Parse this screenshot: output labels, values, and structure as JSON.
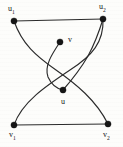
{
  "figure": {
    "type": "undirected-graph-diagram",
    "background_color": "#fdfdfb",
    "edge_color": "#2b2b2b",
    "node_color": "#151515",
    "width": 123,
    "height": 147
  },
  "nodes": [
    {
      "id": "u1",
      "label_main": "u",
      "label_sub": "1",
      "x": 14,
      "y": 21,
      "label_x": 8,
      "label_y": 5,
      "radius": 3.1
    },
    {
      "id": "u2",
      "label_main": "u",
      "label_sub": "2",
      "x": 103,
      "y": 19,
      "label_x": 99,
      "label_y": 3,
      "radius": 3.1
    },
    {
      "id": "v",
      "label_main": "v",
      "label_sub": "",
      "x": 60,
      "y": 42,
      "label_x": 68,
      "label_y": 36,
      "radius": 3.1
    },
    {
      "id": "u",
      "label_main": "u",
      "label_sub": "",
      "x": 63,
      "y": 90,
      "label_x": 61,
      "label_y": 98,
      "radius": 3.1
    },
    {
      "id": "v1",
      "label_main": "v",
      "label_sub": "1",
      "x": 14,
      "y": 125,
      "label_x": 9,
      "label_y": 131,
      "radius": 3.1
    },
    {
      "id": "v2",
      "label_main": "v",
      "label_sub": "2",
      "x": 108,
      "y": 124,
      "label_x": 103,
      "label_y": 131,
      "radius": 3.1
    }
  ],
  "edges": [
    {
      "id": "edge-u1-u2",
      "from": "u1",
      "to": "u2",
      "style": "straight",
      "path": "M 14 21 L 103 19"
    },
    {
      "id": "edge-v1-v2",
      "from": "v1",
      "to": "v2",
      "style": "straight",
      "path": "M 14 125 L 108 124"
    },
    {
      "id": "edge-u1-v2",
      "from": "u1",
      "to": "v2",
      "style": "curved",
      "path": "M 14 21 C 22 44 36 56 56 70 C 76 84 96 100 108 124"
    },
    {
      "id": "edge-u2-v1",
      "from": "u2",
      "to": "v1",
      "style": "curved",
      "path": "M 103 19 C 104 42 92 56 70 70 C 46 86 22 102 14 125"
    },
    {
      "id": "edge-v-u",
      "from": "v",
      "to": "u",
      "style": "curved",
      "path": "M 60 42 C 52 54 44 66 48 77 C 52 86 58 89 63 90"
    },
    {
      "id": "edge-u-right",
      "from": "u",
      "to": "u2-branch",
      "style": "curved",
      "path": "M 63 90 C 70 82 80 70 88 56 C 94 45 99 32 103 19"
    }
  ],
  "legend": {
    "visible": false,
    "caption": ""
  }
}
